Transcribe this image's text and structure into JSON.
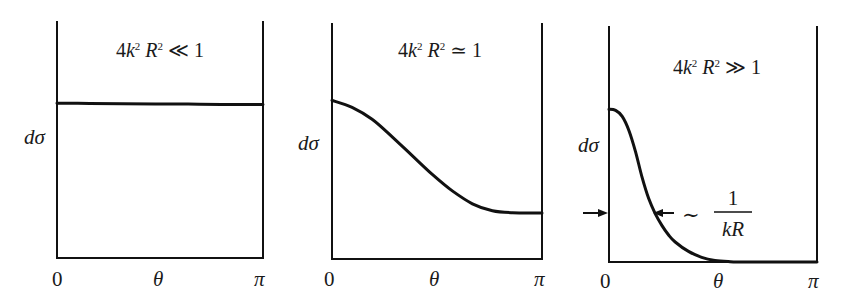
{
  "figure": {
    "line_color": "#111111",
    "background": "#ffffff"
  },
  "chart_data": [
    {
      "type": "line",
      "title": "4k²R² ≪ 1",
      "title_parts": {
        "coef": "4",
        "k": "k",
        "k_exp": "2",
        "R": "R",
        "R_exp": "2",
        "rel": "≪",
        "rhs": "1"
      },
      "xlabel": "θ",
      "ylabel": "dσ",
      "x_ticks": [
        "0",
        "π"
      ],
      "xlim": [
        0,
        3.14159
      ],
      "ylim": [
        0,
        1
      ],
      "grid": false,
      "legend": null,
      "frame": {
        "left": 57,
        "right": 263,
        "top": 22,
        "bottom": 258
      },
      "x": [
        0,
        0.5,
        1.0,
        1.5,
        2.0,
        2.5,
        3.14159
      ],
      "y": [
        0.656,
        0.655,
        0.654,
        0.653,
        0.652,
        0.651,
        0.65
      ],
      "annotations": []
    },
    {
      "type": "line",
      "title": "4k²R² ≃ 1",
      "title_parts": {
        "coef": "4",
        "k": "k",
        "k_exp": "2",
        "R": "R",
        "R_exp": "2",
        "rel": "≃",
        "rhs": "1"
      },
      "xlabel": "θ",
      "ylabel": "dσ",
      "x_ticks": [
        "0",
        "π"
      ],
      "xlim": [
        0,
        3.14159
      ],
      "ylim": [
        0,
        1
      ],
      "grid": false,
      "legend": null,
      "frame": {
        "left": 332,
        "right": 542,
        "top": 24,
        "bottom": 259
      },
      "x": [
        0,
        0.3,
        0.6,
        0.9,
        1.2,
        1.5,
        1.8,
        2.1,
        2.4,
        2.7,
        3.14159
      ],
      "y": [
        0.675,
        0.645,
        0.595,
        0.52,
        0.44,
        0.36,
        0.29,
        0.235,
        0.205,
        0.197,
        0.196
      ],
      "annotations": []
    },
    {
      "type": "line",
      "title": "4k²R² ≫ 1",
      "title_parts": {
        "coef": "4",
        "k": "k",
        "k_exp": "2",
        "R": "R",
        "R_exp": "2",
        "rel": "≫",
        "rhs": "1"
      },
      "xlabel": "θ",
      "ylabel": "dσ",
      "x_ticks": [
        "0",
        "π"
      ],
      "xlim": [
        0,
        3.14159
      ],
      "ylim": [
        0,
        1
      ],
      "grid": false,
      "legend": null,
      "frame": {
        "left": 609,
        "right": 817,
        "top": 27,
        "bottom": 262
      },
      "x": [
        0,
        0.1,
        0.2,
        0.3,
        0.4,
        0.5,
        0.6,
        0.7,
        0.8,
        0.9,
        1.0,
        1.2,
        1.4,
        1.6,
        1.8,
        2.0,
        3.14159
      ],
      "y": [
        0.65,
        0.645,
        0.62,
        0.56,
        0.47,
        0.36,
        0.27,
        0.205,
        0.155,
        0.115,
        0.085,
        0.045,
        0.02,
        0.007,
        0.002,
        0.0,
        0.0
      ],
      "annotations": [
        {
          "type": "width-arrows",
          "y_value": 0.21,
          "x_from": 0,
          "x_to": 0.68,
          "label_prefix": "∼",
          "label_num": "1",
          "label_den": "kR"
        }
      ]
    }
  ]
}
